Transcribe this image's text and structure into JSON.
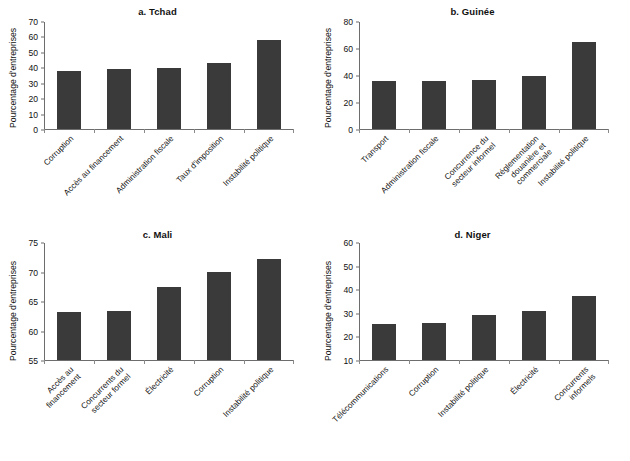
{
  "figure": {
    "axis_title_y": "Pourcentage d'entreprises",
    "bar_color": "#3a3a3a",
    "axis_color": "#6d6d6d",
    "background": "#ffffff"
  },
  "chart_data": [
    {
      "id": "a",
      "type": "bar",
      "title": "a. Tchad",
      "xlabel": "",
      "ylabel": "Pourcentage d'entreprises",
      "ylim": [
        0,
        70
      ],
      "yticks": [
        0,
        10,
        20,
        30,
        40,
        50,
        60,
        70
      ],
      "grid": false,
      "legend": "none",
      "categories": [
        "Corruption",
        "Accès au financement",
        "Administration fiscale",
        "Taux d'imposition",
        "Instabilité politique"
      ],
      "values": [
        38,
        39,
        40,
        43,
        58
      ]
    },
    {
      "id": "b",
      "type": "bar",
      "title": "b. Guinée",
      "xlabel": "",
      "ylabel": "Pourcentage d'entreprises",
      "ylim": [
        0,
        80
      ],
      "yticks": [
        0,
        20,
        40,
        60,
        80
      ],
      "grid": false,
      "legend": "none",
      "categories": [
        "Transport",
        "Administration fiscale",
        "Concurrence du\nsecteur informel",
        "Réglementation\ndouanière et\ncommerciale",
        "Instabilité politique"
      ],
      "values": [
        36,
        36,
        37,
        40,
        65
      ]
    },
    {
      "id": "c",
      "type": "bar",
      "title": "c. Mali",
      "xlabel": "",
      "ylabel": "Pourcentage d'entreprises",
      "ylim": [
        55,
        75
      ],
      "yticks": [
        55,
        60,
        65,
        70,
        75
      ],
      "grid": false,
      "legend": "none",
      "categories": [
        "Accès au\nfinancement",
        "Concurrents du\nsecteur formel",
        "Électricité",
        "Corruption",
        "Instabilité politique"
      ],
      "values": [
        63.2,
        63.4,
        67.4,
        70.1,
        72.2
      ]
    },
    {
      "id": "d",
      "type": "bar",
      "title": "d. Niger",
      "xlabel": "",
      "ylabel": "Pourcentage d'entreprises",
      "ylim": [
        10,
        60
      ],
      "yticks": [
        10,
        20,
        30,
        40,
        50,
        60
      ],
      "grid": false,
      "legend": "none",
      "categories": [
        "Télécommunications",
        "Corruption",
        "Instabilité politique",
        "Électricité",
        "Concurrents\ninformels"
      ],
      "values": [
        25.2,
        25.8,
        29.3,
        30.8,
        37.5
      ]
    }
  ]
}
